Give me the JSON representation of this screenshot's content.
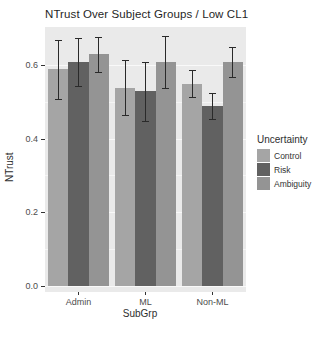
{
  "title": "NTrust Over Subject Groups / Low CL1",
  "axes": {
    "y_label": "NTrust",
    "x_label": "SubGrp",
    "y_ticks": [
      "0.6",
      "0.4",
      "0.2",
      "0.0"
    ],
    "x_ticks": [
      "Admin",
      "ML",
      "Non-ML"
    ]
  },
  "legend": {
    "title": "Uncertainty",
    "items": [
      {
        "label": "Control",
        "color": "#a5a5a5"
      },
      {
        "label": "Risk",
        "color": "#616161"
      },
      {
        "label": "Ambiguity",
        "color": "#949494"
      }
    ]
  },
  "chart_data": {
    "type": "bar",
    "title": "NTrust Over Subject Groups / Low CL1",
    "xlabel": "SubGrp",
    "ylabel": "NTrust",
    "categories": [
      "Admin",
      "ML",
      "Non-ML"
    ],
    "series": [
      {
        "name": "Control",
        "color": "#a5a5a5",
        "values": [
          0.59,
          0.54,
          0.55
        ],
        "errors": [
          0.08,
          0.075,
          0.037
        ]
      },
      {
        "name": "Risk",
        "color": "#616161",
        "values": [
          0.61,
          0.53,
          0.49
        ],
        "errors": [
          0.065,
          0.08,
          0.035
        ]
      },
      {
        "name": "Ambiguity",
        "color": "#949494",
        "values": [
          0.63,
          0.61,
          0.61
        ],
        "errors": [
          0.047,
          0.071,
          0.04
        ]
      }
    ],
    "error_bars": true,
    "ylim": [
      0,
      0.705
    ],
    "y_major_ticks": [
      0.0,
      0.2,
      0.4,
      0.6
    ],
    "y_minor_ticks": [
      0.1,
      0.3,
      0.5
    ],
    "grid": true,
    "legend_title": "Uncertainty",
    "legend_position": "right",
    "panel_bg": "#eaeaea"
  },
  "colors": {
    "panel_bg": "#eaeaea",
    "grid_major": "#f9f9f9",
    "error_bar": "#2a2a2a",
    "axis_text": "#4d4d4d",
    "title_text": "#1f1f1f"
  }
}
